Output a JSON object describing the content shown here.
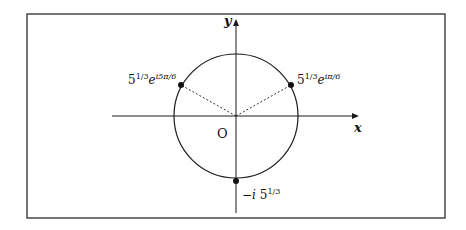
{
  "diagram": {
    "axes": {
      "x_label": "x",
      "y_label": "y",
      "origin_label": "O"
    },
    "circle": {
      "center": [
        236,
        116
      ],
      "radius": 62
    },
    "points": [
      {
        "id": "p1",
        "base": "5",
        "exp_base": "1/3",
        "e": "e",
        "exp_e": "iπ/6",
        "pos": [
          291,
          85
        ]
      },
      {
        "id": "p2",
        "base": "5",
        "exp_base": "1/3",
        "e": "e",
        "exp_e": "i5π/6",
        "pos": [
          181,
          85
        ]
      },
      {
        "id": "p3",
        "prefix": "−i",
        "base": "5",
        "exp_base": "1/3",
        "pos": [
          236,
          181
        ]
      }
    ],
    "colors": {
      "stroke": "#1a1a1a",
      "background": "#ffffff"
    }
  }
}
